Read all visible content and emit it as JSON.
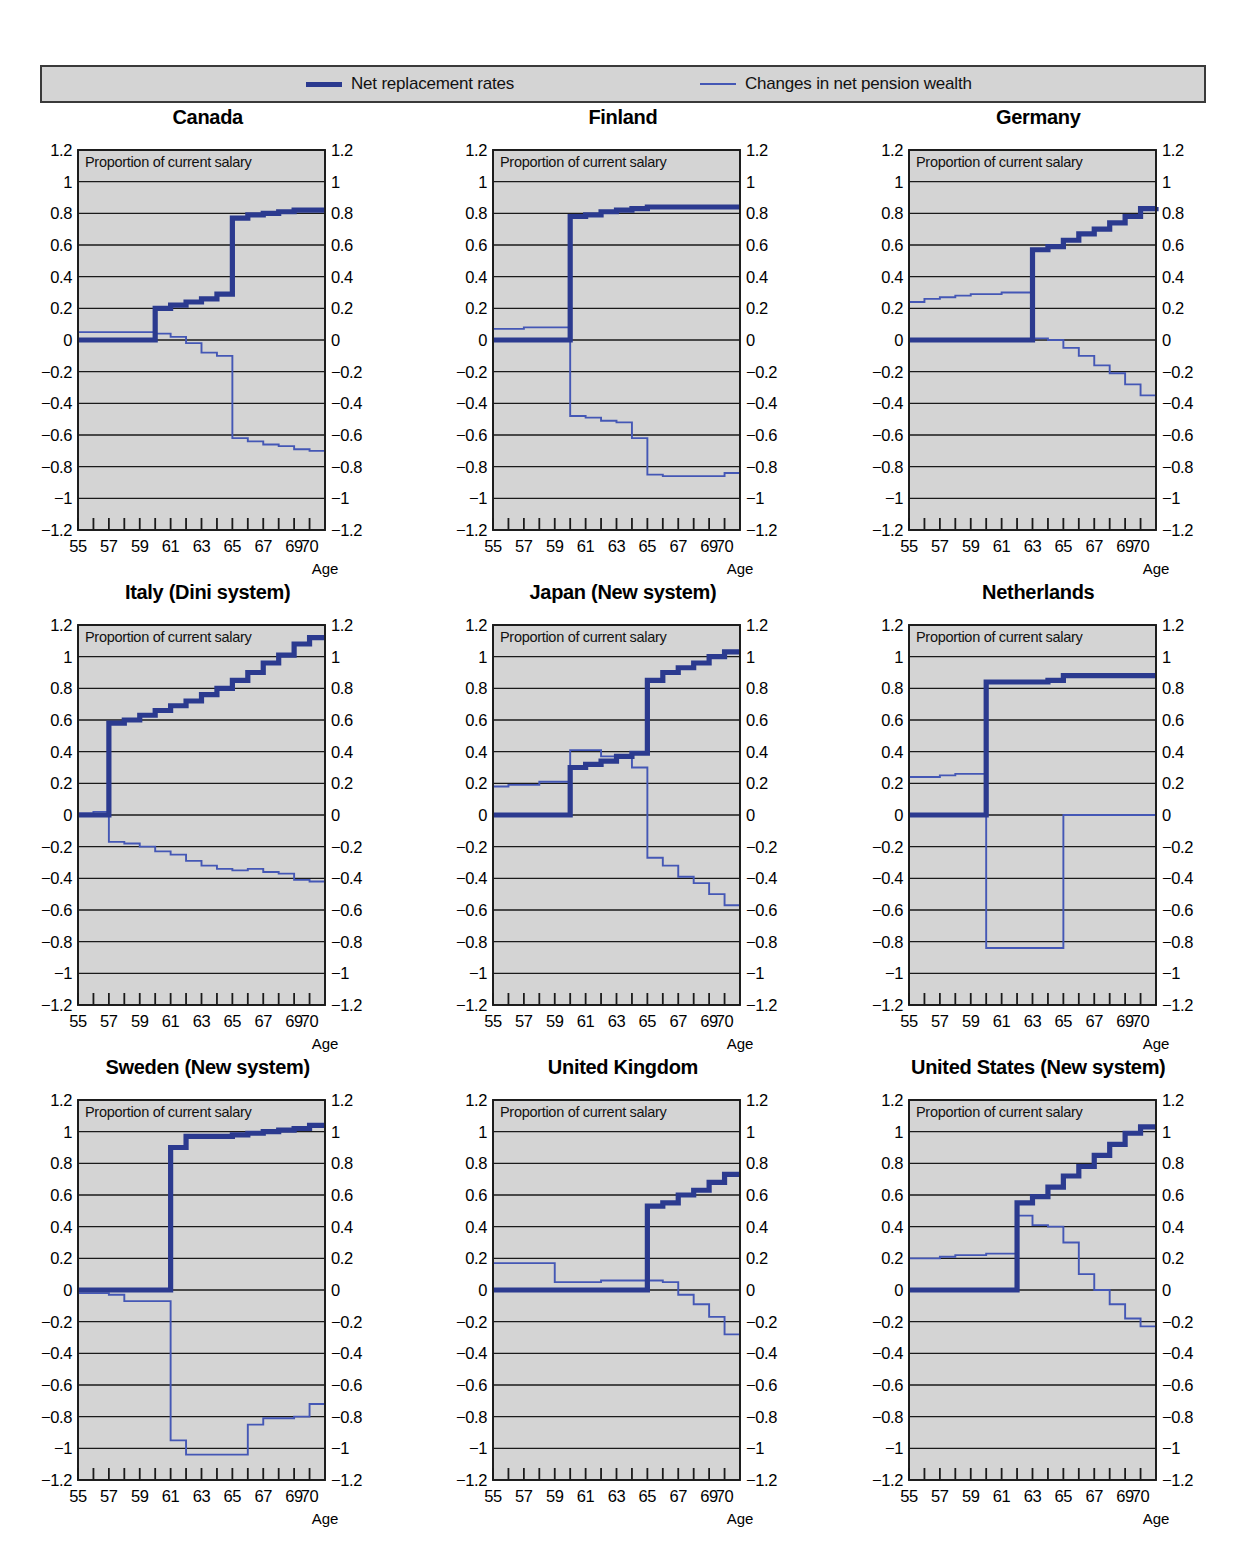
{
  "legend": {
    "entries": [
      {
        "label": "Net replacement rates",
        "style": "thick",
        "color": "#2b3a8f"
      },
      {
        "label": "Changes in net pension wealth",
        "style": "thin",
        "color": "#4457b5"
      }
    ]
  },
  "axes": {
    "inner_note": "Proportion of current salary",
    "xlabel": "Age",
    "ylim": [
      -1.2,
      1.2
    ],
    "xlim": [
      55,
      71
    ],
    "ytick_labels": [
      "1.2",
      "1",
      "0.8",
      "0.6",
      "0.4",
      "0.2",
      "0",
      "−0.2",
      "−0.4",
      "−0.6",
      "−0.8",
      "−1",
      "−1.2"
    ],
    "ytick_values": [
      1.2,
      1,
      0.8,
      0.6,
      0.4,
      0.2,
      0,
      -0.2,
      -0.4,
      -0.6,
      -0.8,
      -1,
      -1.2
    ],
    "xtick_labels": [
      "55",
      "57",
      "59",
      "61",
      "63",
      "65",
      "67",
      "69",
      "70"
    ],
    "xtick_values": [
      55,
      57,
      59,
      61,
      63,
      65,
      67,
      69,
      70
    ],
    "grid": true,
    "plot_bg": "#d4d4d4"
  },
  "chart_data": {
    "type": "line",
    "xlabel": "Age",
    "ylabel": "Proportion of current salary",
    "xlim": [
      55,
      71
    ],
    "ylim": [
      -1.2,
      1.2
    ],
    "grid": true,
    "legend_position": "top",
    "series_names": [
      "Net replacement rates",
      "Changes in net pension wealth"
    ],
    "x": [
      55,
      56,
      57,
      58,
      59,
      60,
      61,
      62,
      63,
      64,
      65,
      66,
      67,
      68,
      69,
      70,
      71
    ],
    "panels": [
      {
        "name": "Canada",
        "series": [
          {
            "name": "Net replacement rates",
            "values": [
              0.0,
              0.0,
              0.0,
              0.0,
              0.0,
              0.2,
              0.22,
              0.24,
              0.26,
              0.29,
              0.77,
              0.79,
              0.8,
              0.81,
              0.82,
              0.82,
              0.82
            ]
          },
          {
            "name": "Changes in net pension wealth",
            "values": [
              0.05,
              0.05,
              0.05,
              0.05,
              0.05,
              0.04,
              0.02,
              -0.02,
              -0.08,
              -0.1,
              -0.62,
              -0.64,
              -0.66,
              -0.67,
              -0.69,
              -0.7,
              -0.7
            ]
          }
        ]
      },
      {
        "name": "Finland",
        "series": [
          {
            "name": "Net replacement rates",
            "values": [
              0.0,
              0.0,
              0.0,
              0.0,
              0.0,
              0.78,
              0.79,
              0.81,
              0.82,
              0.83,
              0.84,
              0.84,
              0.84,
              0.84,
              0.84,
              0.84,
              0.84
            ]
          },
          {
            "name": "Changes in net pension wealth",
            "values": [
              0.07,
              0.07,
              0.08,
              0.08,
              0.08,
              -0.48,
              -0.49,
              -0.51,
              -0.52,
              -0.62,
              -0.85,
              -0.86,
              -0.86,
              -0.86,
              -0.86,
              -0.84,
              -0.84
            ]
          }
        ]
      },
      {
        "name": "Germany",
        "series": [
          {
            "name": "Net replacement rates",
            "values": [
              0.0,
              0.0,
              0.0,
              0.0,
              0.0,
              0.0,
              0.0,
              0.0,
              0.57,
              0.59,
              0.63,
              0.67,
              0.7,
              0.74,
              0.78,
              0.83,
              0.84
            ]
          },
          {
            "name": "Changes in net pension wealth",
            "values": [
              0.24,
              0.26,
              0.27,
              0.28,
              0.29,
              0.29,
              0.3,
              0.3,
              0.01,
              0.0,
              -0.05,
              -0.1,
              -0.16,
              -0.21,
              -0.28,
              -0.35,
              -0.35
            ]
          }
        ]
      },
      {
        "name": "Italy (Dini system)",
        "series": [
          {
            "name": "Net replacement rates",
            "values": [
              0.0,
              0.0,
              0.58,
              0.6,
              0.63,
              0.66,
              0.69,
              0.72,
              0.76,
              0.8,
              0.85,
              0.9,
              0.96,
              1.01,
              1.08,
              1.12,
              1.12
            ]
          },
          {
            "name": "Changes in net pension wealth",
            "values": [
              0.01,
              0.02,
              -0.17,
              -0.18,
              -0.2,
              -0.23,
              -0.25,
              -0.29,
              -0.32,
              -0.34,
              -0.35,
              -0.34,
              -0.36,
              -0.37,
              -0.41,
              -0.42,
              -0.42
            ]
          }
        ]
      },
      {
        "name": "Japan (New system)",
        "series": [
          {
            "name": "Net replacement rates",
            "values": [
              0.0,
              0.0,
              0.0,
              0.0,
              0.0,
              0.3,
              0.32,
              0.34,
              0.37,
              0.39,
              0.85,
              0.9,
              0.93,
              0.96,
              1.0,
              1.03,
              1.03
            ]
          },
          {
            "name": "Changes in net pension wealth",
            "values": [
              0.18,
              0.19,
              0.19,
              0.21,
              0.21,
              0.41,
              0.41,
              0.37,
              0.36,
              0.3,
              -0.27,
              -0.32,
              -0.39,
              -0.43,
              -0.5,
              -0.57,
              -0.57
            ]
          }
        ]
      },
      {
        "name": "Netherlands",
        "series": [
          {
            "name": "Net replacement rates",
            "values": [
              0.0,
              0.0,
              0.0,
              0.0,
              0.0,
              0.84,
              0.84,
              0.84,
              0.84,
              0.85,
              0.88,
              0.88,
              0.88,
              0.88,
              0.88,
              0.88,
              0.88
            ]
          },
          {
            "name": "Changes in net pension wealth",
            "values": [
              0.24,
              0.24,
              0.25,
              0.26,
              0.26,
              -0.84,
              -0.84,
              -0.84,
              -0.84,
              -0.84,
              0.0,
              0.0,
              0.0,
              0.0,
              0.0,
              0.0,
              0.0
            ]
          }
        ]
      },
      {
        "name": "Sweden (New system)",
        "series": [
          {
            "name": "Net replacement rates",
            "values": [
              0.0,
              0.0,
              0.0,
              0.0,
              0.0,
              0.0,
              0.9,
              0.97,
              0.97,
              0.97,
              0.98,
              0.99,
              1.0,
              1.01,
              1.02,
              1.04,
              1.04
            ]
          },
          {
            "name": "Changes in net pension wealth",
            "values": [
              -0.02,
              -0.02,
              -0.03,
              -0.07,
              -0.07,
              -0.07,
              -0.95,
              -1.04,
              -1.04,
              -1.04,
              -1.04,
              -0.85,
              -0.81,
              -0.81,
              -0.8,
              -0.72,
              -0.72
            ]
          }
        ]
      },
      {
        "name": "United Kingdom",
        "series": [
          {
            "name": "Net replacement rates",
            "values": [
              0.0,
              0.0,
              0.0,
              0.0,
              0.0,
              0.0,
              0.0,
              0.0,
              0.0,
              0.0,
              0.53,
              0.55,
              0.6,
              0.63,
              0.68,
              0.73,
              0.73
            ]
          },
          {
            "name": "Changes in net pension wealth",
            "values": [
              0.17,
              0.17,
              0.17,
              0.17,
              0.05,
              0.05,
              0.05,
              0.06,
              0.06,
              0.06,
              0.06,
              0.05,
              -0.03,
              -0.09,
              -0.17,
              -0.28,
              -0.28
            ]
          }
        ]
      },
      {
        "name": "United States (New system)",
        "series": [
          {
            "name": "Net replacement rates",
            "values": [
              0.0,
              0.0,
              0.0,
              0.0,
              0.0,
              0.0,
              0.0,
              0.55,
              0.59,
              0.65,
              0.72,
              0.78,
              0.85,
              0.92,
              0.99,
              1.03,
              1.03
            ]
          },
          {
            "name": "Changes in net pension wealth",
            "values": [
              0.2,
              0.2,
              0.21,
              0.22,
              0.22,
              0.23,
              0.23,
              0.47,
              0.41,
              0.4,
              0.3,
              0.1,
              0.0,
              -0.09,
              -0.18,
              -0.23,
              -0.23
            ]
          }
        ]
      }
    ]
  }
}
